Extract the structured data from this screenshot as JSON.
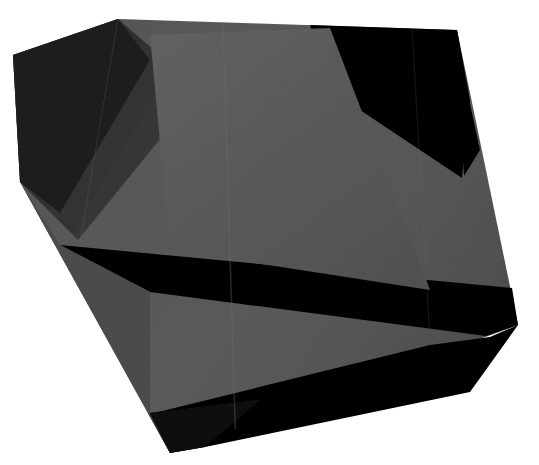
{
  "canvas": {
    "width": 539,
    "height": 465,
    "background_color": "#ffffff",
    "title": "Abstract dark polygonal form"
  },
  "palette": {
    "background": "#ffffff",
    "mid_gray": "#545454",
    "mid_gray_light": "#5c5c5c",
    "mid_gray_dark": "#4a4a4a",
    "shadow_gray": "#3a3a3a",
    "deep_shadow": "#2e2e2e",
    "black": "#060606",
    "near_black": "#0d0d0d",
    "crease_line": "#6a6a6a"
  },
  "chart_data": {
    "type": "scatter",
    "title": "Abstract dark polygonal form",
    "xlabel": "",
    "ylabel": "",
    "xlim": [
      0,
      539
    ],
    "ylim": [
      0,
      465
    ],
    "grid": false,
    "legend_position": "none",
    "shapes": [
      {
        "name": "main-silhouette",
        "role": "base-body",
        "fill": "#545454",
        "points": "118,19 457,30 518,325 170,453 20,182 13,55"
      },
      {
        "name": "upper-left-dark-facet",
        "role": "shadow-facet",
        "fill": "#2e2e2e",
        "points": "118,19 13,55 20,182 78,240 200,90"
      },
      {
        "name": "upper-left-darkest-wedge",
        "role": "shadow-facet",
        "fill": "#1e1e1e",
        "points": "118,19 13,55 20,182 60,213 150,60"
      },
      {
        "name": "upper-right-black-triangle",
        "role": "black-facet",
        "fill": "#060606",
        "points": "310,25 457,30 470,100 462,178 330,90"
      },
      {
        "name": "right-black-sliver",
        "role": "black-facet",
        "fill": "#060606",
        "points": "457,30 470,104 480,150 464,176"
      },
      {
        "name": "mid-black-band",
        "role": "black-facet",
        "fill": "#060606",
        "points": "60,245 512,288 518,325 486,336 150,292"
      },
      {
        "name": "lower-black-wedge",
        "role": "black-facet",
        "fill": "#060606",
        "points": "150,414 430,345 490,337 518,325 470,392 205,447 170,453"
      },
      {
        "name": "bottom-tip-black",
        "role": "black-facet",
        "fill": "#090909",
        "points": "148,413 262,399 205,447 170,453"
      },
      {
        "name": "left-lower-soft-shadow",
        "role": "shadow-facet",
        "fill": "#4a4a4a",
        "points": "20,182 60,245 150,292 150,414 170,453"
      },
      {
        "name": "center-highlight-panel",
        "role": "highlight-facet",
        "fill": "#5c5c5c",
        "points": "150,35 330,28 430,290 170,250"
      }
    ],
    "creases": [
      {
        "name": "vertical-crease-center",
        "from": [
          223,
          22
        ],
        "to": [
          236,
          452
        ],
        "color": "#6a6a6a",
        "opacity": 0.35,
        "width": 1.6
      },
      {
        "name": "vertical-crease-right",
        "from": [
          412,
          28
        ],
        "to": [
          430,
          340
        ],
        "color": "#6a6a6a",
        "opacity": 0.18,
        "width": 1.2
      },
      {
        "name": "diagonal-fold-upper-left",
        "from": [
          118,
          19
        ],
        "to": [
          80,
          242
        ],
        "color": "#707070",
        "opacity": 0.22,
        "width": 1.2
      }
    ]
  },
  "annotations": {
    "description": "A single dark charcoal polygon resembling folded paper, with several flat black triangular facets, set on a plain white field.",
    "facet_count": 10,
    "crease_count": 3
  }
}
